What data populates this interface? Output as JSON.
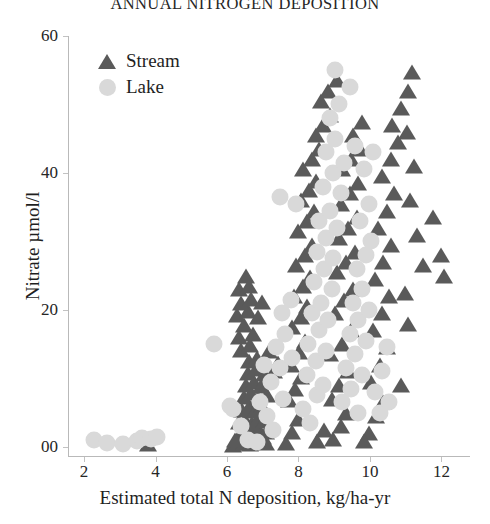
{
  "chart_data": {
    "type": "scatter",
    "title": "ANNUAL NITROGEN DEPOSITION",
    "xlabel": "Estimated total N deposition, kg/ha-yr",
    "ylabel": "Nitrate µmol/l",
    "xlim": [
      1.55,
      12.8
    ],
    "ylim": [
      -1.5,
      60
    ],
    "xticks": [
      2,
      4,
      6,
      8,
      10,
      12
    ],
    "xticklabels": [
      "2",
      "4",
      "6",
      "8",
      "10",
      "12"
    ],
    "yticks": [
      0,
      20,
      40,
      60
    ],
    "yticklabels": [
      "00",
      "20",
      "40",
      "60"
    ],
    "grid": false,
    "legend_position": "upper left",
    "colors": {
      "stream": "#5a5a5a",
      "lake": "#d9d9d9",
      "axis": "#b9b9b9",
      "text": "#1f1f1f",
      "background": "#ffffff"
    },
    "series": [
      {
        "name": "Stream",
        "marker": "triangle",
        "color": "#5a5a5a",
        "points": [
          [
            3.75,
            0.4
          ],
          [
            6.15,
            0.3
          ],
          [
            6.25,
            0.6
          ],
          [
            6.45,
            0.5
          ],
          [
            6.62,
            0.4
          ],
          [
            6.78,
            0.9
          ],
          [
            6.35,
            2.0
          ],
          [
            6.52,
            2.3
          ],
          [
            6.7,
            1.9
          ],
          [
            6.88,
            2.4
          ],
          [
            7.05,
            2.1
          ],
          [
            6.3,
            3.6
          ],
          [
            6.48,
            3.9
          ],
          [
            6.66,
            3.4
          ],
          [
            6.84,
            4.1
          ],
          [
            7.02,
            3.7
          ],
          [
            6.4,
            5.4
          ],
          [
            6.58,
            5.8
          ],
          [
            6.76,
            5.2
          ],
          [
            6.95,
            5.9
          ],
          [
            6.45,
            7.3
          ],
          [
            6.65,
            7.8
          ],
          [
            6.85,
            7.1
          ],
          [
            7.1,
            7.6
          ],
          [
            6.5,
            9.0
          ],
          [
            6.72,
            9.5
          ],
          [
            6.92,
            8.9
          ],
          [
            6.55,
            10.8
          ],
          [
            6.78,
            11.3
          ],
          [
            7.0,
            10.6
          ],
          [
            7.3,
            11.0
          ],
          [
            6.6,
            12.5
          ],
          [
            6.8,
            13.0
          ],
          [
            7.4,
            12.3
          ],
          [
            6.35,
            14.2
          ],
          [
            6.62,
            14.8
          ],
          [
            7.15,
            14.0
          ],
          [
            6.3,
            16.0
          ],
          [
            6.7,
            16.5
          ],
          [
            6.45,
            17.8
          ],
          [
            6.25,
            19.2
          ],
          [
            6.55,
            19.8
          ],
          [
            6.85,
            19.0
          ],
          [
            6.35,
            21.0
          ],
          [
            6.65,
            21.6
          ],
          [
            6.95,
            21.2
          ],
          [
            6.3,
            23.0
          ],
          [
            6.6,
            23.5
          ],
          [
            6.5,
            25.0
          ],
          [
            7.62,
            0.5
          ],
          [
            7.8,
            2.2
          ],
          [
            7.95,
            4.0
          ],
          [
            7.7,
            6.8
          ],
          [
            7.88,
            8.5
          ],
          [
            8.05,
            10.2
          ],
          [
            7.75,
            12.0
          ],
          [
            7.98,
            13.8
          ],
          [
            8.15,
            15.5
          ],
          [
            7.8,
            17.5
          ],
          [
            8.05,
            19.0
          ],
          [
            8.22,
            20.5
          ],
          [
            7.85,
            22.0
          ],
          [
            8.1,
            23.5
          ],
          [
            8.3,
            24.8
          ],
          [
            7.9,
            26.5
          ],
          [
            8.15,
            28.0
          ],
          [
            8.35,
            29.5
          ],
          [
            7.95,
            31.5
          ],
          [
            8.2,
            33.0
          ],
          [
            8.4,
            34.5
          ],
          [
            8.05,
            36.0
          ],
          [
            8.28,
            37.5
          ],
          [
            8.45,
            38.8
          ],
          [
            8.1,
            40.5
          ],
          [
            8.35,
            42.0
          ],
          [
            8.55,
            43.5
          ],
          [
            8.45,
            45.5
          ],
          [
            8.65,
            47.0
          ],
          [
            8.85,
            48.5
          ],
          [
            8.6,
            50.5
          ],
          [
            8.8,
            52.0
          ],
          [
            9.05,
            53.5
          ],
          [
            8.95,
            1.2
          ],
          [
            9.15,
            3.0
          ],
          [
            9.3,
            5.0
          ],
          [
            8.9,
            7.0
          ],
          [
            9.1,
            9.0
          ],
          [
            9.35,
            11.0
          ],
          [
            8.85,
            13.5
          ],
          [
            9.2,
            15.0
          ],
          [
            9.45,
            17.0
          ],
          [
            9.0,
            19.5
          ],
          [
            9.25,
            21.5
          ],
          [
            9.5,
            23.0
          ],
          [
            9.05,
            25.5
          ],
          [
            9.3,
            27.0
          ],
          [
            9.55,
            28.5
          ],
          [
            9.1,
            30.5
          ],
          [
            9.35,
            32.0
          ],
          [
            9.6,
            33.5
          ],
          [
            9.15,
            35.5
          ],
          [
            9.4,
            37.0
          ],
          [
            9.65,
            38.5
          ],
          [
            9.2,
            40.5
          ],
          [
            9.45,
            42.0
          ],
          [
            9.7,
            43.5
          ],
          [
            9.5,
            45.5
          ],
          [
            9.75,
            47.5
          ],
          [
            9.95,
            2.0
          ],
          [
            10.15,
            4.5
          ],
          [
            10.35,
            6.5
          ],
          [
            10.0,
            9.5
          ],
          [
            10.25,
            12.0
          ],
          [
            10.45,
            14.5
          ],
          [
            10.05,
            17.0
          ],
          [
            10.3,
            19.5
          ],
          [
            10.5,
            22.0
          ],
          [
            10.1,
            24.5
          ],
          [
            10.35,
            27.0
          ],
          [
            10.55,
            29.5
          ],
          [
            10.2,
            32.0
          ],
          [
            10.45,
            34.5
          ],
          [
            10.65,
            37.0
          ],
          [
            10.3,
            39.5
          ],
          [
            10.55,
            42.0
          ],
          [
            10.75,
            44.5
          ],
          [
            10.6,
            47.0
          ],
          [
            10.85,
            49.5
          ],
          [
            11.05,
            52.0
          ],
          [
            11.15,
            54.8
          ],
          [
            11.0,
            46.0
          ],
          [
            11.2,
            41.0
          ],
          [
            11.1,
            36.0
          ],
          [
            11.3,
            31.0
          ],
          [
            11.45,
            26.5
          ],
          [
            10.95,
            22.5
          ],
          [
            11.05,
            18.0
          ],
          [
            10.85,
            9.0
          ],
          [
            11.95,
            28.0
          ],
          [
            12.05,
            25.0
          ],
          [
            11.75,
            33.5
          ],
          [
            7.05,
            0.6
          ],
          [
            6.98,
            1.4
          ],
          [
            6.2,
            1.0
          ],
          [
            8.5,
            0.8
          ],
          [
            8.7,
            2.5
          ],
          [
            9.8,
            0.9
          ]
        ]
      },
      {
        "name": "Lake",
        "marker": "circle",
        "color": "#d9d9d9",
        "points": [
          [
            2.25,
            1.0
          ],
          [
            2.6,
            0.5
          ],
          [
            3.05,
            0.4
          ],
          [
            3.45,
            0.8
          ],
          [
            3.6,
            1.3
          ],
          [
            3.85,
            1.2
          ],
          [
            4.0,
            1.4
          ],
          [
            5.6,
            15.0
          ],
          [
            6.15,
            5.5
          ],
          [
            6.35,
            3.0
          ],
          [
            6.55,
            1.0
          ],
          [
            6.9,
            6.5
          ],
          [
            7.1,
            4.5
          ],
          [
            7.25,
            2.5
          ],
          [
            7.2,
            9.5
          ],
          [
            7.45,
            11.5
          ],
          [
            7.55,
            7.0
          ],
          [
            7.35,
            14.5
          ],
          [
            7.6,
            16.5
          ],
          [
            7.8,
            13.0
          ],
          [
            7.5,
            19.5
          ],
          [
            7.75,
            21.5
          ],
          [
            7.45,
            36.5
          ],
          [
            7.9,
            35.5
          ],
          [
            8.1,
            5.5
          ],
          [
            8.3,
            3.5
          ],
          [
            8.5,
            7.5
          ],
          [
            8.2,
            10.5
          ],
          [
            8.45,
            12.5
          ],
          [
            8.65,
            9.0
          ],
          [
            8.25,
            15.0
          ],
          [
            8.55,
            17.0
          ],
          [
            8.75,
            14.0
          ],
          [
            8.35,
            19.5
          ],
          [
            8.6,
            21.0
          ],
          [
            8.8,
            18.5
          ],
          [
            8.4,
            24.0
          ],
          [
            8.7,
            26.0
          ],
          [
            8.9,
            23.0
          ],
          [
            8.5,
            28.5
          ],
          [
            8.75,
            30.5
          ],
          [
            8.95,
            27.5
          ],
          [
            8.55,
            33.0
          ],
          [
            8.85,
            34.5
          ],
          [
            9.05,
            32.0
          ],
          [
            8.65,
            38.0
          ],
          [
            8.95,
            40.0
          ],
          [
            9.15,
            37.0
          ],
          [
            8.75,
            43.0
          ],
          [
            9.0,
            45.0
          ],
          [
            9.25,
            41.5
          ],
          [
            8.85,
            48.0
          ],
          [
            9.1,
            50.0
          ],
          [
            9.4,
            52.5
          ],
          [
            9.2,
            6.5
          ],
          [
            9.45,
            8.5
          ],
          [
            9.65,
            5.0
          ],
          [
            9.3,
            11.5
          ],
          [
            9.55,
            13.5
          ],
          [
            9.75,
            10.5
          ],
          [
            9.4,
            16.5
          ],
          [
            9.65,
            18.5
          ],
          [
            9.85,
            15.5
          ],
          [
            9.5,
            21.0
          ],
          [
            9.75,
            23.0
          ],
          [
            9.95,
            20.0
          ],
          [
            9.6,
            26.0
          ],
          [
            9.85,
            28.0
          ],
          [
            9.7,
            33.0
          ],
          [
            9.95,
            35.5
          ],
          [
            9.8,
            40.5
          ],
          [
            10.05,
            43.0
          ],
          [
            10.1,
            8.0
          ],
          [
            10.3,
            11.0
          ],
          [
            10.45,
            14.5
          ],
          [
            10.25,
            5.0
          ],
          [
            10.5,
            6.5
          ],
          [
            6.05,
            6.0
          ],
          [
            6.8,
            0.7
          ],
          [
            7.0,
            12.0
          ],
          [
            9.0,
            55.0
          ],
          [
            9.55,
            44.0
          ],
          [
            10.0,
            30.0
          ]
        ]
      }
    ]
  },
  "axes": {
    "xtick_positions": [
      2,
      4,
      6,
      8,
      10,
      12
    ],
    "ytick_positions": [
      0,
      20,
      40,
      60
    ]
  },
  "legend": {
    "entries": [
      {
        "label": "Stream",
        "icon": "triangle-marker-icon"
      },
      {
        "label": "Lake",
        "icon": "circle-marker-icon"
      }
    ]
  }
}
